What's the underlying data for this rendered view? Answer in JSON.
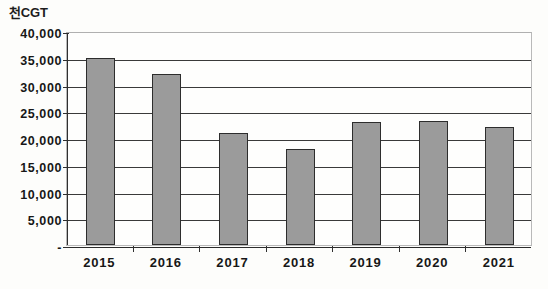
{
  "chart_data": {
    "type": "bar",
    "title": "",
    "subtitle": "",
    "unit_label": "천CGT",
    "xlabel": "",
    "ylabel": "",
    "categories": [
      "2015",
      "2016",
      "2017",
      "2018",
      "2019",
      "2020",
      "2021"
    ],
    "values": [
      35000,
      32000,
      21000,
      18000,
      23000,
      23200,
      22000
    ],
    "series": [
      {
        "name": "CGT",
        "values": [
          35000,
          32000,
          21000,
          18000,
          23000,
          23200,
          22000
        ]
      }
    ],
    "ylim": [
      0,
      40000
    ],
    "ytick_values": [
      0,
      5000,
      10000,
      15000,
      20000,
      25000,
      30000,
      35000,
      40000
    ],
    "ytick_labels": [
      "-",
      "5,000",
      "10,000",
      "15,000",
      "20,000",
      "25,000",
      "30,000",
      "35,000",
      "40,000"
    ],
    "grid": true,
    "grid_axis": "y",
    "legend": false,
    "legend_position": "none",
    "bar_fill_color": "#9b9b9b",
    "bar_border_color": "#2d2d2d",
    "gridline_color": "#3a3a3a",
    "axis_color": "#2f2f2f",
    "text_color": "#171717",
    "background_color": "#fdfdfb"
  }
}
